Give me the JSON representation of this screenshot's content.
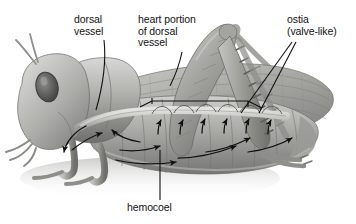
{
  "figure": {
    "background_color": "#ffffff",
    "text_color": "#111111",
    "line_color": "#101010"
  },
  "labels": {
    "dorsal_vessel": "dorsal\nvessel",
    "heart_portion": "heart portion\nof dorsal\nvessel",
    "ostia": "ostia\n(valve-like)",
    "hemocoel": "hemocoel"
  },
  "annotations": {
    "leader_lines": 5,
    "bracket_label": "heart portion of dorsal vessel",
    "flow_arrows": 13,
    "ostia_arrows": 6
  },
  "organism": {
    "common_name": "grasshopper",
    "orientation": "facing left",
    "rendering": "grayscale airbrush illustration"
  }
}
